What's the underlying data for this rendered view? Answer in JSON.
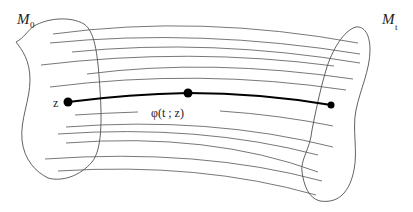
{
  "diagram": {
    "type": "flow-map-illustration",
    "labels": {
      "initial_set": {
        "main": "M",
        "sub": "0"
      },
      "final_set": {
        "main": "M",
        "sub": "t"
      },
      "start_point": "z",
      "trajectory": "φ(t ; z)"
    },
    "colors": {
      "background": "#ffffff",
      "outline": "#3a3a3a",
      "flow_lines": "#555555",
      "trajectory": "#000000"
    },
    "nodes": [
      {
        "id": "z",
        "x": 68,
        "y": 102,
        "r": 4.5
      },
      {
        "id": "mid",
        "x": 188,
        "y": 93,
        "r": 4.5
      },
      {
        "id": "end",
        "x": 331,
        "y": 105,
        "r": 3.5
      }
    ],
    "flow_lines_count": 13
  }
}
